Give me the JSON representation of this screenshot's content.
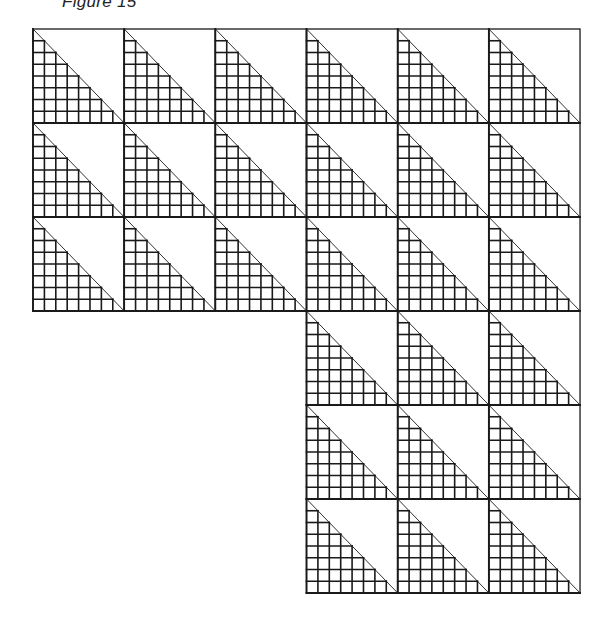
{
  "figure": {
    "title": "Figure 15",
    "stroke_color": "#1a1a1a",
    "background_color": "#ffffff",
    "grid_subdivisions": 8,
    "tile_width": 91.17,
    "tile_height": 94,
    "origin": {
      "x": 33,
      "y": 29
    },
    "right_edge": 580,
    "layout": {
      "rows": [
        {
          "row": 0,
          "start_col": 0,
          "cols": 6
        },
        {
          "row": 1,
          "start_col": 0,
          "cols": 6
        },
        {
          "row": 2,
          "start_col": 0,
          "cols": 6
        },
        {
          "row": 3,
          "start_col": 3,
          "cols": 3
        },
        {
          "row": 4,
          "start_col": 3,
          "cols": 3
        },
        {
          "row": 5,
          "start_col": 3,
          "cols": 3
        }
      ],
      "total_tiles": 27
    }
  }
}
